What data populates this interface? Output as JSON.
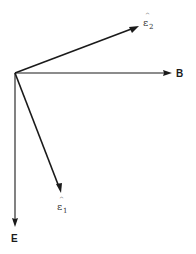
{
  "diagram": {
    "type": "vector-diagram",
    "origin": {
      "x": 15,
      "y": 73
    },
    "vectors": [
      {
        "id": "epsilon2",
        "symbol": "ε",
        "hat": "^",
        "subscript": "2",
        "end": {
          "x": 139,
          "y": 26
        },
        "label_pos": {
          "x": 144,
          "y": 26
        },
        "weight": "heavy"
      },
      {
        "id": "B",
        "label": "B",
        "end": {
          "x": 172,
          "y": 73
        },
        "label_pos": {
          "x": 176,
          "y": 77
        },
        "weight": "light"
      },
      {
        "id": "epsilon1",
        "symbol": "ε",
        "hat": "^",
        "subscript": "1",
        "end": {
          "x": 61,
          "y": 193
        },
        "label_pos": {
          "x": 58,
          "y": 210
        },
        "weight": "heavy"
      },
      {
        "id": "E",
        "label": "E",
        "end": {
          "x": 15,
          "y": 227
        },
        "label_pos": {
          "x": 11,
          "y": 242
        },
        "weight": "light"
      }
    ],
    "colors": {
      "stroke": "#1a1a1a",
      "background": "#ffffff"
    }
  }
}
